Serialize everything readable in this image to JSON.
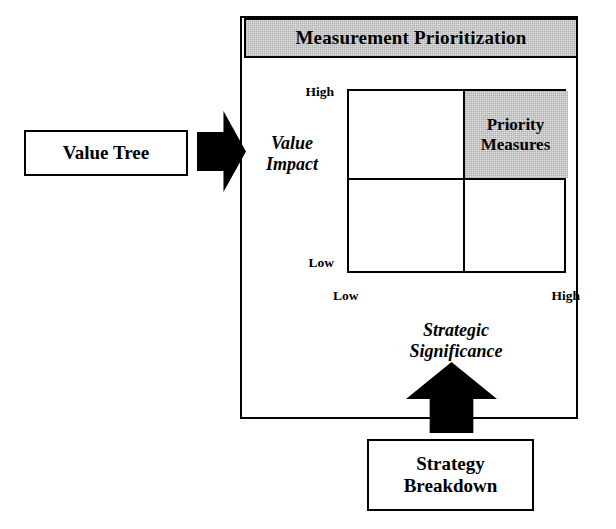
{
  "diagram": {
    "panel": {
      "header_title": "Measurement Prioritization"
    },
    "matrix": {
      "highlight_cell_label": "Priority\nMeasures",
      "highlight_cell_line1": "Priority",
      "highlight_cell_line2": "Measures",
      "y_axis": {
        "title_line1": "Value",
        "title_line2": "Impact",
        "tick_high": "High",
        "tick_low": "Low"
      },
      "x_axis": {
        "title_line1": "Strategic",
        "title_line2": "Significance",
        "tick_low": "Low",
        "tick_high": "High"
      }
    },
    "inputs": {
      "value_tree_label": "Value Tree",
      "strategy_breakdown_line1": "Strategy",
      "strategy_breakdown_line2": "Breakdown"
    },
    "icons": {
      "input_arrow_right": "arrow-right-icon",
      "input_arrow_up": "arrow-up-icon"
    },
    "colors": {
      "stroke": "#000000",
      "shaded_fill": "#dedede",
      "background": "#ffffff"
    }
  }
}
